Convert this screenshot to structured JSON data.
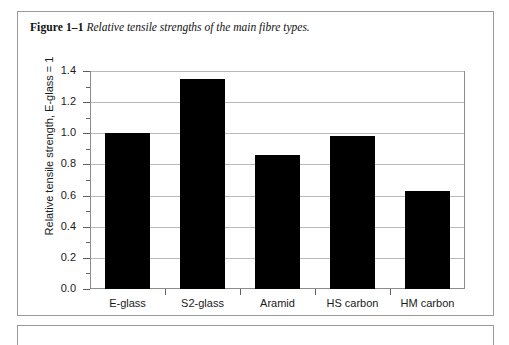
{
  "figure": {
    "label": "Figure 1–1",
    "caption": "Relative tensile strengths of the main fibre types."
  },
  "chart_data": {
    "type": "bar",
    "title": "Relative tensile strengths of the main fibre types.",
    "categories": [
      "E-glass",
      "S2-glass",
      "Aramid",
      "HS carbon",
      "HM carbon"
    ],
    "values": [
      1.0,
      1.35,
      0.86,
      0.98,
      0.63
    ],
    "xlabel": "",
    "ylabel": "Relative tensile strength, E-glass = 1",
    "ylim": [
      0.0,
      1.4
    ],
    "ytick_labels": [
      "0.0",
      "0.2",
      "0.4",
      "0.6",
      "0.8",
      "1.0",
      "1.2",
      "1.4"
    ],
    "ytick_values": [
      0.0,
      0.2,
      0.4,
      0.6,
      0.8,
      1.0,
      1.2,
      1.4
    ],
    "minor_tick_step": 0.1,
    "grid": true,
    "grid_axis": "y",
    "legend": null,
    "bar_color": "#000000",
    "grid_color": "#b9b9b9",
    "axis_color": "#8d8d8d"
  }
}
